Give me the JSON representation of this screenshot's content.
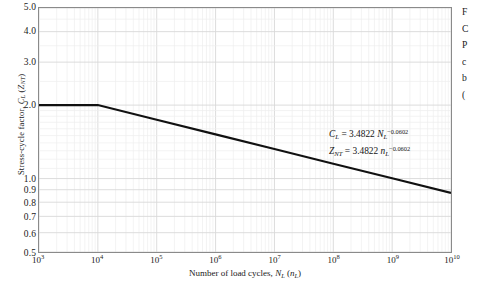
{
  "figure": {
    "background_color": "#ffffff",
    "axis_color": "#8a8a8a",
    "curve_color": "#111111",
    "grid_major_color": "#d8d8d8",
    "grid_minor_color": "#eeeeee"
  },
  "chart_data": {
    "type": "line",
    "title": "",
    "xlabel_plain": "Number of load cycles, N_L (n_L)",
    "ylabel_plain": "Stress-cycle factor, C_L (Z_NT)",
    "xscale": "log",
    "yscale": "log",
    "xlim": [
      1000,
      10000000000
    ],
    "ylim": [
      0.5,
      5.0
    ],
    "grid": true,
    "legend": "none",
    "x_tick_values": [
      1000,
      10000,
      100000,
      1000000,
      10000000,
      100000000,
      1000000000,
      10000000000
    ],
    "x_tick_labels": [
      "10",
      "10",
      "10",
      "10",
      "10",
      "10",
      "10",
      "10"
    ],
    "x_tick_exponents": [
      "3",
      "4",
      "5",
      "6",
      "7",
      "8",
      "9",
      "10"
    ],
    "y_tick_values": [
      0.5,
      0.6,
      0.7,
      0.8,
      0.9,
      1.0,
      2.0,
      3.0,
      4.0,
      5.0
    ],
    "y_tick_labels": [
      "0.5",
      "0.6",
      "0.7",
      "0.8",
      "0.9",
      "1.0",
      "2.0",
      "3.0",
      "4.0",
      "5.0"
    ],
    "series": [
      {
        "name": "Stress-cycle factor curve",
        "equation": "C_L = 3.4822 N_L^-0.0602",
        "coefficient": 3.4822,
        "exponent": -0.0602,
        "knee_x": 10000,
        "knee_y": 2.0,
        "x": [
          1000,
          10000,
          100000,
          1000000,
          10000000,
          100000000,
          1000000000,
          10000000000
        ],
        "y": [
          2.0,
          2.0,
          1.742,
          1.517,
          1.321,
          1.15,
          1.002,
          0.873
        ]
      }
    ],
    "annotations": [
      "C_L = 3.4822 N_L^-0.0602",
      "Z_NT = 3.4822 n_L^-0.0602"
    ]
  },
  "axis": {
    "y_title": {
      "prefix": "Stress-cycle factor, ",
      "symbol1": "C",
      "symbol1_sub": "L",
      "mid": " (",
      "symbol2": "Z",
      "symbol2_sub": "NT",
      "suffix": ")"
    },
    "x_title": {
      "prefix": "Number of load cycles, ",
      "symbol1": "N",
      "symbol1_sub": "L",
      "mid": " (",
      "symbol2": "n",
      "symbol2_sub": "L",
      "suffix": ")"
    }
  },
  "annotation": {
    "line1": {
      "lhs": "C",
      "lhs_sub": "L",
      "eq": " = 3.4822 ",
      "var": "N",
      "var_sub": "L",
      "exp": "−0.0602"
    },
    "line2": {
      "lhs": "Z",
      "lhs_sub": "NT",
      "eq": " = 3.4822 ",
      "var": "n",
      "var_sub": "L",
      "exp": "−0.0602"
    }
  },
  "side_caption": {
    "visible_fragments": [
      "F",
      "C",
      "P",
      "c",
      "b",
      "("
    ]
  }
}
